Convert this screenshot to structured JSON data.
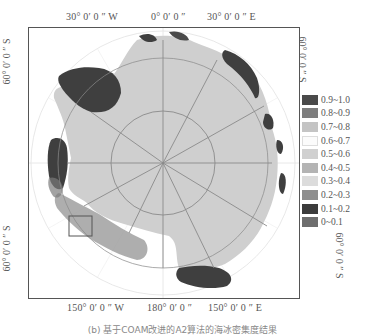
{
  "figure": {
    "caption": "(b) 基于COAM改进的A2算法的海冰密集度结果",
    "top_labels": [
      "30° 0′ 0 ″ W",
      "0° 0′ 0 ″",
      "30° 0′ 0 ″ E"
    ],
    "bottom_labels": [
      "150° 0′ 0 ″ W",
      "180° 0′ 0 ″",
      "150° 0′ 0 ″ E"
    ],
    "left_labels": [
      "60° 0′ 0 ″ S",
      "60° 0′ 0 ″ S"
    ],
    "right_labels": [
      "60° 0′ 0 ″ S",
      "60° 0′ 0 ″ S"
    ]
  },
  "legend": {
    "items": [
      {
        "label": "0.9~1.0",
        "color": "#4a4a4a"
      },
      {
        "label": "0.8~0.9",
        "color": "#7e7e7e"
      },
      {
        "label": "0.7~0.8",
        "color": "#c4c4c4"
      },
      {
        "label": "0.6~0.7",
        "color": "#fbfbfb"
      },
      {
        "label": "0.5~0.6",
        "color": "#d0d0d0"
      },
      {
        "label": "0.4~0.5",
        "color": "#b4b4b4"
      },
      {
        "label": "0.3~0.4",
        "color": "#dcdcdc"
      },
      {
        "label": "0.2~0.3",
        "color": "#8e8e8e"
      },
      {
        "label": "0.1~0.2",
        "color": "#3c3c3c"
      },
      {
        "label": "0~0.1",
        "color": "#6e6e6e"
      }
    ]
  },
  "map": {
    "continent_color": "#cfcfcf",
    "ice_dark_color": "#3f3f3f",
    "graticule_color": "#8a8a8a"
  }
}
